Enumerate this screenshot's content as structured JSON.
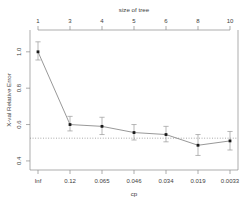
{
  "chart_data": {
    "type": "line",
    "title": "",
    "top_axis_label": "size of tree",
    "xlabel": "cp",
    "ylabel": "X-val Relative Error",
    "x_tick_labels": [
      "Inf",
      "0.12",
      "0.065",
      "0.046",
      "0.034",
      "0.019",
      "0.0033"
    ],
    "top_tick_labels": [
      "1",
      "3",
      "4",
      "5",
      "6",
      "8",
      "10"
    ],
    "y_tick_labels": [
      "1.0",
      "0.8",
      "0.6",
      "0.4"
    ],
    "y_tick_values": [
      1.0,
      0.8,
      0.6,
      0.4
    ],
    "ylim": [
      0.35,
      1.12
    ],
    "grid": false,
    "legend": "none",
    "reference_line": {
      "orientation": "horizontal",
      "value": 0.525,
      "style": "dotted",
      "label": "1-SE threshold"
    },
    "series": [
      {
        "name": "X-val Relative Error",
        "x": [
          "Inf",
          "0.12",
          "0.065",
          "0.046",
          "0.034",
          "0.019",
          "0.0033"
        ],
        "tree_size": [
          1,
          3,
          4,
          5,
          6,
          8,
          10
        ],
        "values": [
          1.0,
          0.6,
          0.59,
          0.556,
          0.545,
          0.486,
          0.51
        ],
        "errors_lower": [
          0.955,
          0.565,
          0.545,
          0.515,
          0.505,
          0.43,
          0.46
        ],
        "errors_upper": [
          1.055,
          0.645,
          0.64,
          0.6,
          0.59,
          0.545,
          0.562
        ]
      }
    ]
  }
}
